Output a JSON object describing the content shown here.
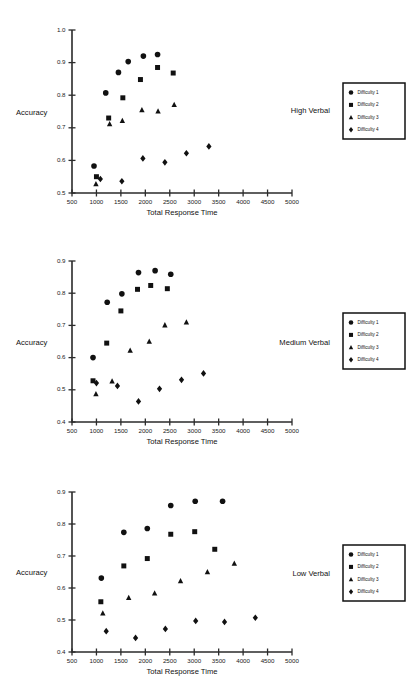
{
  "figure": {
    "marker_color": "#111111",
    "axis_color": "#2b2b2b",
    "background": "#ffffff"
  },
  "legend": {
    "items": [
      {
        "label": "Difficulty 1",
        "marker": "circle"
      },
      {
        "label": "Difficulty 2",
        "marker": "square"
      },
      {
        "label": "Difficulty 3",
        "marker": "triangle"
      },
      {
        "label": "Difficulty 4",
        "marker": "diamond"
      }
    ]
  },
  "chart_data": [
    {
      "type": "scatter",
      "title": "High Verbal",
      "xlabel": "Total Response Time",
      "ylabel": "Accuracy",
      "xlim": [
        500,
        5000
      ],
      "ylim": [
        0.5,
        1.0
      ],
      "xticks": [
        500,
        1000,
        1500,
        2000,
        2500,
        3000,
        3500,
        4000,
        4500,
        5000
      ],
      "yticks": [
        0.5,
        0.6,
        0.7,
        0.8,
        0.9,
        1.0
      ],
      "ytick_labels": [
        "0.5",
        "0.6",
        "0.7",
        "0.8",
        "0.9",
        "1.0"
      ],
      "grid": false,
      "legend_position": "right-outside",
      "series": [
        {
          "name": "Difficulty 1",
          "marker": "circle",
          "points": [
            [
              950,
              0.583
            ],
            [
              1190,
              0.807
            ],
            [
              1450,
              0.87
            ],
            [
              1650,
              0.903
            ],
            [
              1960,
              0.92
            ],
            [
              2250,
              0.925
            ]
          ]
        },
        {
          "name": "Difficulty 2",
          "marker": "square",
          "points": [
            [
              1000,
              0.55
            ],
            [
              1250,
              0.73
            ],
            [
              1540,
              0.792
            ],
            [
              1900,
              0.848
            ],
            [
              2250,
              0.885
            ],
            [
              2570,
              0.868
            ]
          ]
        },
        {
          "name": "Difficulty 3",
          "marker": "triangle",
          "points": [
            [
              990,
              0.528
            ],
            [
              1270,
              0.712
            ],
            [
              1530,
              0.722
            ],
            [
              1930,
              0.755
            ],
            [
              2260,
              0.751
            ],
            [
              2590,
              0.771
            ]
          ]
        },
        {
          "name": "Difficulty 4",
          "marker": "diamond",
          "points": [
            [
              1080,
              0.543
            ],
            [
              1520,
              0.536
            ],
            [
              1950,
              0.606
            ],
            [
              2400,
              0.594
            ],
            [
              2840,
              0.622
            ],
            [
              3300,
              0.643
            ]
          ]
        }
      ]
    },
    {
      "type": "scatter",
      "title": "Medium Verbal",
      "xlabel": "Total Response Time",
      "ylabel": "Accuracy",
      "xlim": [
        500,
        5000
      ],
      "ylim": [
        0.4,
        0.9
      ],
      "xticks": [
        500,
        1000,
        1500,
        2000,
        2500,
        3000,
        3500,
        4000,
        4500,
        5000
      ],
      "yticks": [
        0.4,
        0.5,
        0.6,
        0.7,
        0.8,
        0.9
      ],
      "ytick_labels": [
        "0.4",
        "0.5",
        "0.6",
        "0.7",
        "0.8",
        "0.9"
      ],
      "grid": false,
      "legend_position": "right-outside",
      "series": [
        {
          "name": "Difficulty 1",
          "marker": "circle",
          "points": [
            [
              930,
              0.6
            ],
            [
              1220,
              0.772
            ],
            [
              1520,
              0.798
            ],
            [
              1860,
              0.864
            ],
            [
              2200,
              0.87
            ],
            [
              2520,
              0.859
            ]
          ]
        },
        {
          "name": "Difficulty 2",
          "marker": "square",
          "points": [
            [
              930,
              0.528
            ],
            [
              1210,
              0.645
            ],
            [
              1500,
              0.745
            ],
            [
              1840,
              0.812
            ],
            [
              2110,
              0.824
            ],
            [
              2450,
              0.814
            ]
          ]
        },
        {
          "name": "Difficulty 3",
          "marker": "triangle",
          "points": [
            [
              990,
              0.487
            ],
            [
              1320,
              0.527
            ],
            [
              1690,
              0.622
            ],
            [
              2080,
              0.65
            ],
            [
              2400,
              0.701
            ],
            [
              2840,
              0.71
            ]
          ]
        },
        {
          "name": "Difficulty 4",
          "marker": "diamond",
          "points": [
            [
              1000,
              0.521
            ],
            [
              1430,
              0.512
            ],
            [
              1860,
              0.464
            ],
            [
              2290,
              0.503
            ],
            [
              2740,
              0.531
            ],
            [
              3190,
              0.551
            ]
          ]
        }
      ]
    },
    {
      "type": "scatter",
      "title": "Low Verbal",
      "xlabel": "Total Response Time",
      "ylabel": "Accuracy",
      "xlim": [
        500,
        5000
      ],
      "ylim": [
        0.4,
        0.9
      ],
      "xticks": [
        500,
        1000,
        1500,
        2000,
        2500,
        3000,
        3500,
        4000,
        4500,
        5000
      ],
      "yticks": [
        0.4,
        0.5,
        0.6,
        0.7,
        0.8,
        0.9
      ],
      "ytick_labels": [
        "0.4",
        "0.5",
        "0.6",
        "0.7",
        "0.8",
        "0.9"
      ],
      "grid": false,
      "legend_position": "right-outside",
      "series": [
        {
          "name": "Difficulty 1",
          "marker": "circle",
          "points": [
            [
              1100,
              0.631
            ],
            [
              1560,
              0.774
            ],
            [
              2040,
              0.786
            ],
            [
              2520,
              0.858
            ],
            [
              3020,
              0.871
            ],
            [
              3580,
              0.871
            ]
          ]
        },
        {
          "name": "Difficulty 2",
          "marker": "square",
          "points": [
            [
              1090,
              0.557
            ],
            [
              1560,
              0.669
            ],
            [
              2040,
              0.692
            ],
            [
              2520,
              0.768
            ],
            [
              3010,
              0.776
            ],
            [
              3420,
              0.721
            ]
          ]
        },
        {
          "name": "Difficulty 3",
          "marker": "triangle",
          "points": [
            [
              1130,
              0.521
            ],
            [
              1660,
              0.57
            ],
            [
              2190,
              0.584
            ],
            [
              2720,
              0.622
            ],
            [
              3270,
              0.65
            ],
            [
              3820,
              0.677
            ]
          ]
        },
        {
          "name": "Difficulty 4",
          "marker": "diamond",
          "points": [
            [
              1200,
              0.465
            ],
            [
              1800,
              0.444
            ],
            [
              2410,
              0.472
            ],
            [
              3030,
              0.497
            ],
            [
              3620,
              0.494
            ],
            [
              4250,
              0.507
            ]
          ]
        }
      ]
    }
  ]
}
